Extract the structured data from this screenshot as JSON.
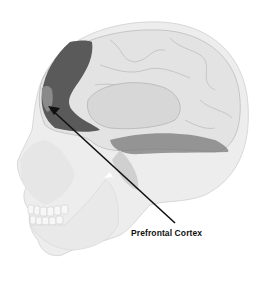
{
  "figure": {
    "highlighted_region": "Prefrontal Cortex",
    "label": "Prefrontal Cortex",
    "colors": {
      "background": "#ffffff",
      "skull": "#eeeeee",
      "brain": "#e2e2e2",
      "highlight": "#5a5a5a",
      "highlight_inner": "#8a8a8a",
      "cerebellum_shadow": "#7a7a7a",
      "arrow": "#111111"
    }
  }
}
